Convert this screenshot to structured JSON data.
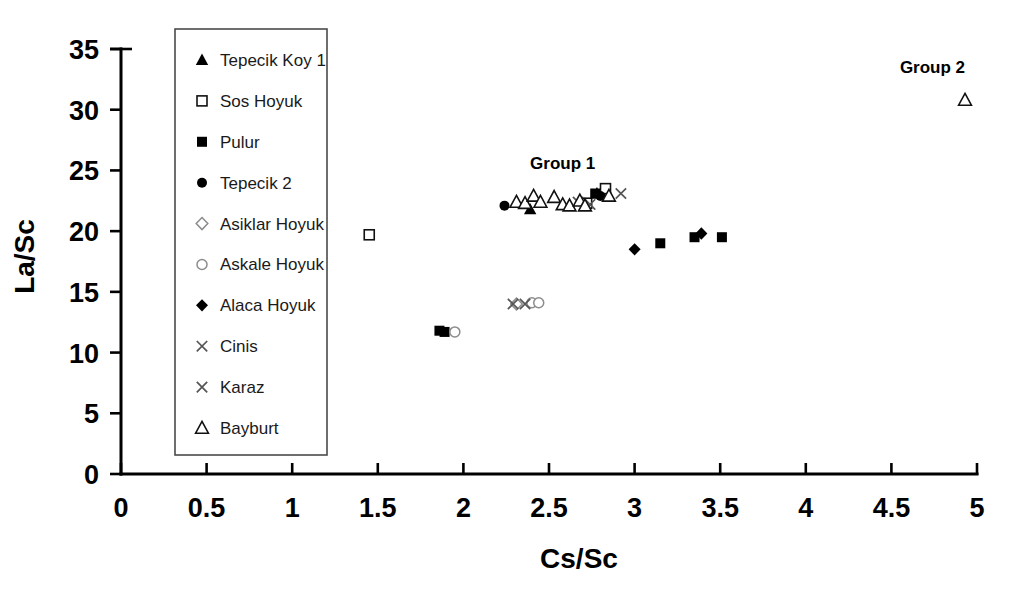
{
  "chart": {
    "type": "scatter",
    "title": "",
    "xlabel": "Cs/Sc",
    "ylabel": "La/Sc",
    "xlim": [
      0,
      5
    ],
    "ylim": [
      0,
      35
    ],
    "xticks": [
      "0",
      "0.5",
      "1",
      "1.5",
      "2",
      "2.5",
      "3",
      "3.5",
      "4",
      "4.5",
      "5"
    ],
    "yticks": [
      "0",
      "5",
      "10",
      "15",
      "20",
      "25",
      "30",
      "35"
    ],
    "grid": false,
    "legend_position": "upper-left-inside"
  },
  "annotations": [
    {
      "text": "Group 1",
      "x": 2.58,
      "y": 25.1
    },
    {
      "text": "Group 2",
      "x": 4.74,
      "y": 33.0
    }
  ],
  "legend": {
    "items": [
      {
        "label": "Tepecik Koy 1",
        "marker": "filled-triangle"
      },
      {
        "label": "Sos Hoyuk",
        "marker": "open-square"
      },
      {
        "label": "Pulur",
        "marker": "filled-square"
      },
      {
        "label": "Tepecik 2",
        "marker": "filled-circle"
      },
      {
        "label": "Asiklar Hoyuk",
        "marker": "open-diamond"
      },
      {
        "label": "Askale Hoyuk",
        "marker": "open-circle"
      },
      {
        "label": "Alaca Hoyuk",
        "marker": "filled-diamond"
      },
      {
        "label": "Cinis",
        "marker": "x-mark"
      },
      {
        "label": "Karaz",
        "marker": "x-mark"
      },
      {
        "label": "Bayburt",
        "marker": "open-triangle"
      }
    ]
  },
  "chart_data": {
    "type": "scatter",
    "title": "",
    "xlabel": "Cs/Sc",
    "ylabel": "La/Sc",
    "xlim": [
      0,
      5
    ],
    "ylim": [
      0,
      35
    ],
    "xticks": [
      0,
      0.5,
      1,
      1.5,
      2,
      2.5,
      3,
      3.5,
      4,
      4.5,
      5
    ],
    "yticks": [
      0,
      5,
      10,
      15,
      20,
      25,
      30,
      35
    ],
    "grid": false,
    "legend_position": "upper-left-inside",
    "annotations": [
      {
        "text": "Group 1",
        "x": 2.58,
        "y": 25.1
      },
      {
        "text": "Group 2",
        "x": 4.74,
        "y": 33.0
      }
    ],
    "series": [
      {
        "name": "Tepecik Koy 1",
        "marker": "filled-triangle",
        "points": [
          {
            "x": 2.39,
            "y": 21.8
          },
          {
            "x": 2.78,
            "y": 23.1
          }
        ]
      },
      {
        "name": "Sos Hoyuk",
        "marker": "open-square",
        "points": [
          {
            "x": 1.45,
            "y": 19.7
          },
          {
            "x": 2.83,
            "y": 23.5
          },
          {
            "x": 2.72,
            "y": 22.3
          }
        ]
      },
      {
        "name": "Pulur",
        "marker": "filled-square",
        "points": [
          {
            "x": 1.86,
            "y": 11.8
          },
          {
            "x": 1.89,
            "y": 11.7
          },
          {
            "x": 3.15,
            "y": 19.0
          },
          {
            "x": 3.35,
            "y": 19.5
          },
          {
            "x": 3.51,
            "y": 19.5
          },
          {
            "x": 2.77,
            "y": 23.1
          }
        ]
      },
      {
        "name": "Tepecik 2",
        "marker": "filled-circle",
        "points": [
          {
            "x": 2.24,
            "y": 22.1
          },
          {
            "x": 2.8,
            "y": 22.9
          }
        ]
      },
      {
        "name": "Asiklar Hoyuk",
        "marker": "open-diamond",
        "points": [
          {
            "x": 2.31,
            "y": 14.0
          }
        ]
      },
      {
        "name": "Askale Hoyuk",
        "marker": "open-circle",
        "points": [
          {
            "x": 1.95,
            "y": 11.7
          },
          {
            "x": 2.4,
            "y": 14.1
          },
          {
            "x": 2.44,
            "y": 14.1
          }
        ]
      },
      {
        "name": "Alaca Hoyuk",
        "marker": "filled-diamond",
        "points": [
          {
            "x": 3.0,
            "y": 18.5
          },
          {
            "x": 3.39,
            "y": 19.8
          }
        ]
      },
      {
        "name": "Cinis",
        "marker": "x-mark",
        "points": [
          {
            "x": 2.29,
            "y": 14.0
          },
          {
            "x": 2.36,
            "y": 14.0
          },
          {
            "x": 2.74,
            "y": 22.2
          }
        ]
      },
      {
        "name": "Karaz",
        "marker": "x-mark",
        "points": [
          {
            "x": 2.92,
            "y": 23.1
          },
          {
            "x": 2.67,
            "y": 22.4
          }
        ]
      },
      {
        "name": "Bayburt",
        "marker": "open-triangle",
        "points": [
          {
            "x": 2.31,
            "y": 22.4
          },
          {
            "x": 2.36,
            "y": 22.3
          },
          {
            "x": 2.41,
            "y": 22.9
          },
          {
            "x": 2.45,
            "y": 22.4
          },
          {
            "x": 2.53,
            "y": 22.8
          },
          {
            "x": 2.58,
            "y": 22.2
          },
          {
            "x": 2.62,
            "y": 22.1
          },
          {
            "x": 2.68,
            "y": 22.5
          },
          {
            "x": 2.71,
            "y": 22.1
          },
          {
            "x": 2.85,
            "y": 22.9
          },
          {
            "x": 4.93,
            "y": 30.8
          }
        ]
      }
    ]
  }
}
